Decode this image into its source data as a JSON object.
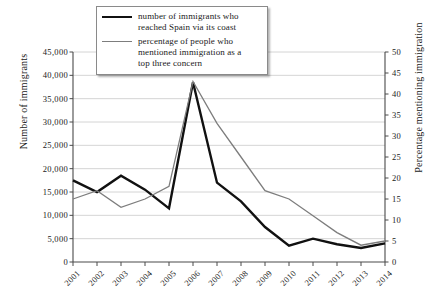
{
  "chart_data": {
    "type": "line",
    "title": "",
    "xlabel": "",
    "ylabel": "Number of immigrants",
    "y2label": "Percentage mentioning immigration",
    "grid": true,
    "legend_position": "top-center",
    "x": [
      "2001",
      "2002",
      "2003",
      "2004",
      "2005",
      "2006",
      "2007",
      "2008",
      "2009",
      "2010",
      "2011",
      "2012",
      "2013",
      "2014"
    ],
    "categories": [
      "2001",
      "2002",
      "2003",
      "2004",
      "2005",
      "2006",
      "2007",
      "2008",
      "2009",
      "2010",
      "2011",
      "2012",
      "2013",
      "2014"
    ],
    "ylim": [
      0,
      45000
    ],
    "y2lim": [
      0,
      50
    ],
    "yticks": [
      0,
      5000,
      10000,
      15000,
      20000,
      25000,
      30000,
      35000,
      40000,
      45000
    ],
    "ytick_labels": [
      "0",
      "5,000",
      "10,000",
      "15,000",
      "20,000",
      "25,000",
      "30,000",
      "35,000",
      "40,000",
      "45,000"
    ],
    "y2ticks": [
      0,
      5,
      10,
      15,
      20,
      25,
      30,
      35,
      40,
      45,
      50
    ],
    "y2tick_labels": [
      "0",
      "5",
      "10",
      "15",
      "20",
      "25",
      "30",
      "35",
      "40",
      "45",
      "50"
    ],
    "series": [
      {
        "name": "number of immigrants who reached Spain via its coast",
        "axis": "left",
        "color": "#111111",
        "width": 2.4,
        "values": [
          17500,
          15000,
          18500,
          15500,
          11500,
          38500,
          17000,
          13000,
          7500,
          3500,
          5000,
          3800,
          3000,
          4000
        ]
      },
      {
        "name": "percentage of people who mentioned immigration as a top three concern",
        "axis": "right",
        "color": "#7d7d7d",
        "width": 1.3,
        "values": [
          15,
          17,
          13,
          15,
          18,
          43,
          33,
          25,
          17,
          15,
          11,
          7,
          4,
          5
        ]
      }
    ]
  },
  "legend": {
    "entries": [
      {
        "label_line1": "number of immigrants who",
        "label_line2": "reached Spain via its coast",
        "swatch": "black-thick-line"
      },
      {
        "label_line1": "percentage of people who",
        "label_line2": "mentioned immigration as a",
        "label_line3": "top three concern",
        "swatch": "gray-thin-line"
      }
    ]
  },
  "colors": {
    "immigrants_line": "#111111",
    "percentage_line": "#7d7d7d",
    "gridline": "#c9c9c9",
    "axis": "#4a4a4a",
    "background": "#ffffff"
  }
}
